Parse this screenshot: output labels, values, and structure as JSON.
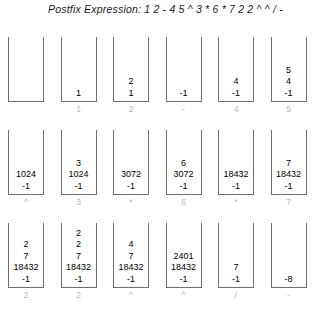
{
  "header": {
    "title": "Postfix Expression: 1 2 - 4 5 ^ 3 * 6 * 7 2 2 ^ ^ / -"
  },
  "colors": {
    "stack_border": "#6e6e6e",
    "item_text": "#000000",
    "label_text": "#b9b9b9",
    "background": "#ffffff"
  },
  "evaluation": {
    "expression_tokens": [
      "1",
      "2",
      "-",
      "4",
      "5",
      "^",
      "3",
      "*",
      "6",
      "*",
      "7",
      "2",
      "2",
      "^",
      "^",
      "/",
      "-"
    ],
    "rows": [
      {
        "row_index": 0,
        "steps": [
          {
            "label": "",
            "items": []
          },
          {
            "label": "1",
            "items": [
              "1"
            ]
          },
          {
            "label": "2",
            "items": [
              "2",
              "1"
            ]
          },
          {
            "label": "-",
            "items": [
              "-1"
            ]
          },
          {
            "label": "4",
            "items": [
              "4",
              "-1"
            ]
          },
          {
            "label": "5",
            "items": [
              "5",
              "4",
              "-1"
            ]
          }
        ]
      },
      {
        "row_index": 1,
        "steps": [
          {
            "label": "^",
            "items": [
              "1024",
              "-1"
            ]
          },
          {
            "label": "3",
            "items": [
              "3",
              "1024",
              "-1"
            ]
          },
          {
            "label": "*",
            "items": [
              "3072",
              "-1"
            ]
          },
          {
            "label": "6",
            "items": [
              "6",
              "3072",
              "-1"
            ]
          },
          {
            "label": "*",
            "items": [
              "18432",
              "-1"
            ]
          },
          {
            "label": "7",
            "items": [
              "7",
              "18432",
              "-1"
            ]
          }
        ]
      },
      {
        "row_index": 2,
        "steps": [
          {
            "label": "2",
            "items": [
              "2",
              "7",
              "18432",
              "-1"
            ]
          },
          {
            "label": "2",
            "items": [
              "2",
              "2",
              "7",
              "18432",
              "-1"
            ]
          },
          {
            "label": "^",
            "items": [
              "4",
              "7",
              "18432",
              "-1"
            ]
          },
          {
            "label": "^",
            "items": [
              "2401",
              "18432",
              "-1"
            ]
          },
          {
            "label": "/",
            "items": [
              "7",
              "-1"
            ]
          },
          {
            "label": "-",
            "items": [
              "-8"
            ]
          }
        ]
      }
    ]
  }
}
